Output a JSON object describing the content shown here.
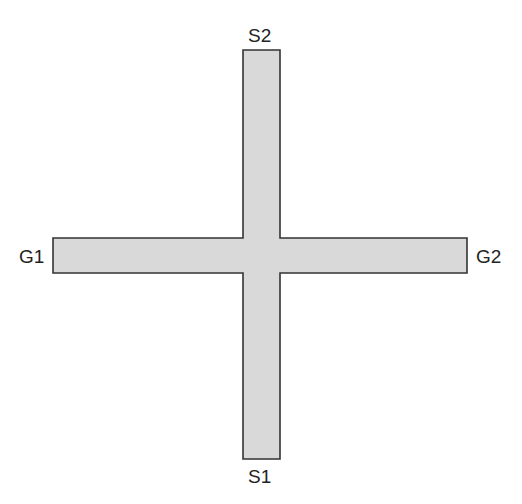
{
  "diagram": {
    "shape": "cross",
    "fill_color": "#d9d9d9",
    "stroke_color": "#333333",
    "vertical_bar": {
      "x": 243,
      "y": 50,
      "width": 37,
      "height": 409
    },
    "horizontal_bar": {
      "x": 53,
      "y": 238,
      "width": 414,
      "height": 35
    },
    "terminals": {
      "top": "S2",
      "bottom": "S1",
      "left": "G1",
      "right": "G2"
    }
  }
}
